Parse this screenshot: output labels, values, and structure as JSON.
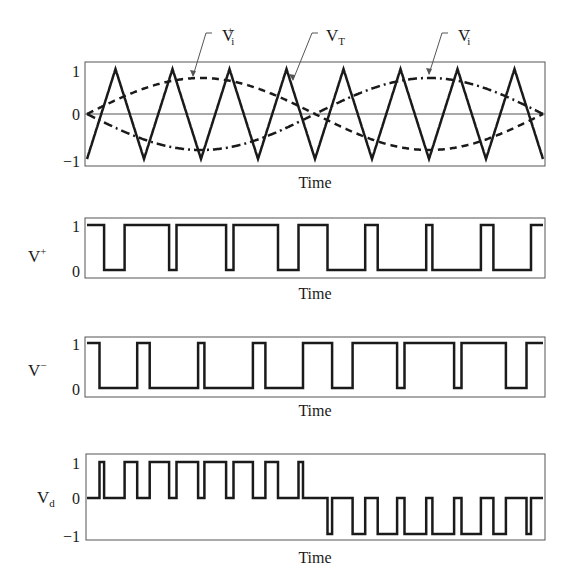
{
  "chart_data": [
    {
      "type": "line",
      "panel": 1,
      "title": "",
      "xlabel": "Time",
      "ylabel": "",
      "ylim": [
        -1,
        1
      ],
      "yticks": [
        "1",
        "0",
        "-1"
      ],
      "annotations": [
        {
          "label": "V_i^+",
          "base": "V",
          "sub": "i",
          "sup": "+",
          "points_to": "dashed sinusoid (reference V_i+)"
        },
        {
          "label": "V_T",
          "base": "V",
          "sub": "T",
          "points_to": "triangular carrier"
        },
        {
          "label": "V_i^-",
          "base": "V",
          "sub": "i",
          "sup": "−",
          "points_to": "dash-dot sinusoid (reference V_i-)"
        }
      ],
      "series": [
        {
          "name": "V_T",
          "style": "solid",
          "shape": "triangle",
          "amplitude": 1,
          "cycles": 8,
          "start": -1
        },
        {
          "name": "V_i+",
          "style": "dashed",
          "shape": "sine",
          "amplitude": 0.8,
          "cycles": 1
        },
        {
          "name": "V_i-",
          "style": "dash-dot",
          "shape": "sine",
          "amplitude": 0.8,
          "cycles": 1,
          "phase": "inverted"
        }
      ]
    },
    {
      "type": "line",
      "panel": 2,
      "ylabel": "V+",
      "xlabel": "Time",
      "ylim": [
        0,
        1
      ],
      "yticks": [
        "1",
        "0"
      ],
      "series": [
        {
          "name": "V+",
          "style": "solid",
          "shape": "pwm",
          "levels": [
            0,
            1
          ]
        }
      ]
    },
    {
      "type": "line",
      "panel": 3,
      "ylabel": "V−",
      "xlabel": "Time",
      "ylim": [
        0,
        1
      ],
      "yticks": [
        "1",
        "0"
      ],
      "series": [
        {
          "name": "V-",
          "style": "solid",
          "shape": "pwm",
          "levels": [
            0,
            1
          ]
        }
      ]
    },
    {
      "type": "line",
      "panel": 4,
      "ylabel": "V_d",
      "xlabel": "Time",
      "ylim": [
        -1,
        1
      ],
      "yticks": [
        "1",
        "0",
        "-1"
      ],
      "series": [
        {
          "name": "V_d",
          "style": "solid",
          "shape": "unipolar pwm",
          "levels": [
            -1,
            0,
            1
          ]
        }
      ]
    }
  ],
  "labels": {
    "time": "Time",
    "vplus_base": "V",
    "vplus_sup": "+",
    "vminus_base": "V",
    "vminus_sup": "−",
    "vd_base": "V",
    "vd_sub": "d",
    "vip_base": "V",
    "vip_sub": "i",
    "vip_sup": "+",
    "vt_base": "V",
    "vt_sub": "T",
    "vim_base": "V",
    "vim_sub": "i",
    "vim_sup": "−"
  },
  "ticks": {
    "one": "1",
    "zero": "0",
    "minus_one": "−1"
  },
  "colors": {
    "line": "#1a1a1a",
    "frame": "#555555"
  }
}
